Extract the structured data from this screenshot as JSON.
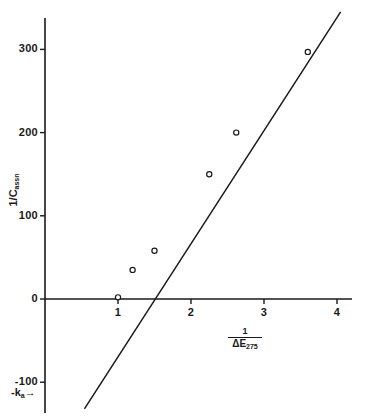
{
  "chart_data": {
    "type": "scatter",
    "title": "",
    "subtitle": "",
    "xlabel": "1 / ΔE275",
    "ylabel": "1 / Cassn",
    "xlabel_numerator": "1",
    "xlabel_denominator_symbol": "ΔE",
    "xlabel_denominator_subscript": "275",
    "ylabel_main": "1/C",
    "ylabel_subscript": "assn",
    "xlim": [
      0.0,
      4.35
    ],
    "ylim": [
      -145,
      360
    ],
    "grid": false,
    "legend": false,
    "xticks": [
      1,
      2,
      3,
      4
    ],
    "xtick_labels": [
      "1",
      "2",
      "3",
      "4"
    ],
    "yticks": [
      -100,
      0,
      100,
      200,
      300
    ],
    "ytick_labels": [
      "-100",
      "0",
      "100",
      "200",
      "300"
    ],
    "points": [
      {
        "x": 1.0,
        "y": 2
      },
      {
        "x": 1.2,
        "y": 35
      },
      {
        "x": 1.5,
        "y": 58
      },
      {
        "x": 2.25,
        "y": 150
      },
      {
        "x": 2.62,
        "y": 200
      },
      {
        "x": 3.6,
        "y": 297
      }
    ],
    "series": [
      {
        "name": "data",
        "marker": "open-circle",
        "x": [
          1.0,
          1.2,
          1.5,
          2.25,
          2.62,
          3.6
        ],
        "values": [
          2,
          35,
          58,
          150,
          200,
          297
        ]
      }
    ],
    "fit_line": {
      "name": "linear fit",
      "x_start": 0.54,
      "y_start": -132,
      "x_end": 4.05,
      "y_end": 345,
      "slope": 136,
      "x_intercept": 1.0,
      "y_intercept": -136
    },
    "annotations": [
      {
        "name": "negative-k-intercept",
        "text": "-k",
        "subscript": "a",
        "arrow": "→",
        "x": 0.55,
        "y": -136
      }
    ]
  },
  "axes": {
    "x_axis_name": "x-axis",
    "y_axis_name": "y-axis"
  }
}
